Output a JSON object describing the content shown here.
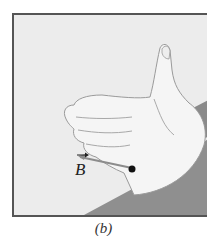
{
  "figure": {
    "label": "B",
    "label_decoration": "vector-arrow",
    "caption": "(b)",
    "colors": {
      "background": "#ececec",
      "frame": "#555555",
      "band": "#8a8a8a",
      "hand_fill": "#f4f4f4",
      "hand_outline": "#9a9a9a",
      "dot": "#111111"
    }
  }
}
